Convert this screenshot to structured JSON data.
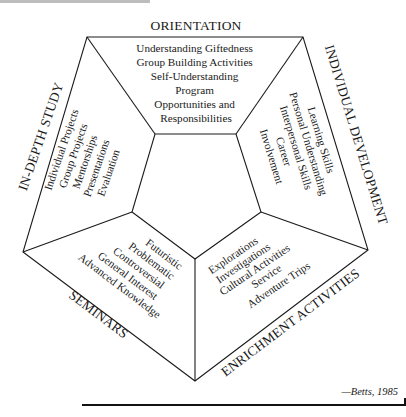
{
  "diagram": {
    "type": "pentagon-model",
    "center": {
      "label": ""
    },
    "sections": [
      {
        "id": "orientation",
        "title": "ORIENTATION",
        "items": [
          "Understanding Giftedness",
          "Group Building Activities",
          "Self-Understanding",
          "Program",
          "Opportunities and",
          "Responsibilities"
        ]
      },
      {
        "id": "individual-development",
        "title": "INDIVIDUAL DEVELOPMENT",
        "items": [
          "Learning Skills",
          "Personal Understanding",
          "Interpersonal Skills",
          "Career",
          "Involvement"
        ]
      },
      {
        "id": "enrichment-activities",
        "title": "ENRICHMENT ACTIVITIES",
        "items": [
          "Explorations",
          "Investigations",
          "Cultural Activities",
          "Service",
          "Adventure Trips"
        ]
      },
      {
        "id": "seminars",
        "title": "SEMINARS",
        "items": [
          "Futuristic",
          "Problematic",
          "Controversial",
          "General Interest",
          "Advanced Knowledge"
        ]
      },
      {
        "id": "in-depth-study",
        "title": "IN-DEPTH STUDY",
        "items": [
          "Individual Projects",
          "Group Projects",
          "Mentorships",
          "Presentations",
          "Evaluation"
        ]
      }
    ]
  },
  "citation": "—Betts, 1985",
  "colors": {
    "ink": "#1a1a1a",
    "background": "#ffffff"
  }
}
